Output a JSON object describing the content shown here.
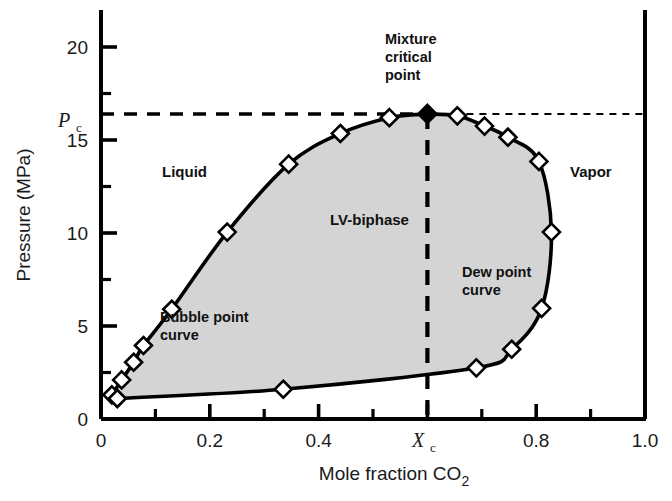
{
  "chart_data": {
    "type": "line",
    "title": "",
    "xlabel": "Mole fraction CO2",
    "ylabel": "Pressure (MPa)",
    "xlim": [
      0.0,
      1.0
    ],
    "ylim": [
      0.0,
      21.5
    ],
    "grid": false,
    "legend": "none",
    "x_ticks_major": [
      "0",
      "0.2",
      "0.4",
      "Xc",
      "0.8",
      "1.0"
    ],
    "x_tick_values": [
      0.0,
      0.2,
      0.4,
      0.6,
      0.8,
      1.0
    ],
    "x_minor_step": 0.1,
    "y_ticks_major": [
      "0",
      "5",
      "10",
      "15",
      "20"
    ],
    "y_tick_values": [
      0,
      5,
      10,
      15,
      20
    ],
    "y_minor_step": 2.5,
    "critical_pressure_label": "Pc",
    "critical_pressure_value": 16.4,
    "critical_composition_label": "Xc",
    "critical_composition_value": 0.6,
    "series": [
      {
        "name": "Bubble point curve",
        "marker": "open-diamond",
        "points": [
          {
            "x": 0.02,
            "y": 1.3
          },
          {
            "x": 0.038,
            "y": 2.1
          },
          {
            "x": 0.06,
            "y": 3.05
          },
          {
            "x": 0.078,
            "y": 3.95
          },
          {
            "x": 0.13,
            "y": 5.9
          },
          {
            "x": 0.232,
            "y": 10.05
          },
          {
            "x": 0.345,
            "y": 13.7
          },
          {
            "x": 0.44,
            "y": 15.35
          },
          {
            "x": 0.53,
            "y": 16.2
          },
          {
            "x": 0.6,
            "y": 16.4
          }
        ]
      },
      {
        "name": "Dew point curve",
        "marker": "open-diamond",
        "points": [
          {
            "x": 0.6,
            "y": 16.4
          },
          {
            "x": 0.655,
            "y": 16.3
          },
          {
            "x": 0.705,
            "y": 15.75
          },
          {
            "x": 0.748,
            "y": 15.15
          },
          {
            "x": 0.805,
            "y": 13.85
          },
          {
            "x": 0.828,
            "y": 10.05
          },
          {
            "x": 0.81,
            "y": 5.95
          },
          {
            "x": 0.755,
            "y": 3.75
          },
          {
            "x": 0.69,
            "y": 2.75
          },
          {
            "x": 0.335,
            "y": 1.6
          },
          {
            "x": 0.03,
            "y": 1.1
          }
        ]
      }
    ],
    "critical_point": {
      "name": "Mixture critical point",
      "marker": "filled-diamond",
      "x": 0.6,
      "y": 16.4
    },
    "region_labels": [
      {
        "text": "Liquid",
        "x": 0.11,
        "y": 13.6
      },
      {
        "text": "Vapor",
        "x": 0.87,
        "y": 13.6
      },
      {
        "text": "LV-biphase",
        "x": 0.395,
        "y": 11.4
      }
    ],
    "curve_annotations": [
      {
        "lines": [
          "Bubble point",
          "curve"
        ],
        "x": 0.215,
        "y": 6.2
      },
      {
        "lines": [
          "Dew point",
          "curve"
        ],
        "x": 0.69,
        "y": 7.6
      }
    ],
    "callouts": [
      {
        "lines": [
          "Mixture",
          "critical",
          "point"
        ],
        "x": 0.6,
        "y": 20.6
      }
    ],
    "guides": [
      {
        "kind": "horizontal-dashed",
        "label": "Pc",
        "value": 16.4
      },
      {
        "kind": "vertical-dashed",
        "label": "Xc",
        "value": 0.6
      }
    ],
    "shaded_region": {
      "name": "LV-biphase",
      "fill": "#d4d4d4"
    }
  },
  "style": {
    "axis_color": "#000000",
    "curve_color": "#000000",
    "marker_fill": "#ffffff",
    "marker_stroke": "#000000",
    "biphase_fill": "#d4d4d4",
    "text_color": "#1a1a1a"
  },
  "axis_titles": {
    "x": "Mole fraction CO",
    "x_sub": "2",
    "y": "Pressure (MPa)"
  },
  "annotations": {
    "mixture_critical_l1": "Mixture",
    "mixture_critical_l2": "critical",
    "mixture_critical_l3": "point",
    "liquid": "Liquid",
    "vapor": "Vapor",
    "lv_biphase": "LV-biphase",
    "bubble_l1": "Bubble point",
    "bubble_l2": "curve",
    "dew_l1": "Dew point",
    "dew_l2": "curve",
    "pc_symbol": "P",
    "pc_sub": "c",
    "xc_symbol": "X",
    "xc_sub": "c"
  },
  "ticks": {
    "x": [
      "0",
      "0.2",
      "0.4",
      "0.8",
      "1.0"
    ],
    "y": [
      "20",
      "15",
      "10",
      "5",
      "0"
    ]
  }
}
